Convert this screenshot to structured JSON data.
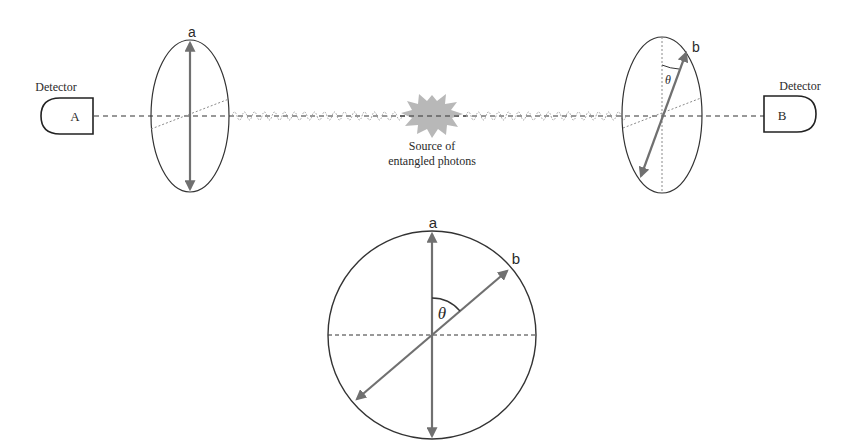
{
  "figure": {
    "detectors": [
      {
        "id": "A",
        "caption": "Detector",
        "letter": "A",
        "side": "left"
      },
      {
        "id": "B",
        "caption": "Detector",
        "letter": "B",
        "side": "right"
      }
    ],
    "polarizers": [
      {
        "id": "a",
        "label": "a",
        "axis_angle_deg": 0
      },
      {
        "id": "b",
        "label": "b",
        "axis_angle_deg": 20,
        "angle_label": "θ"
      }
    ],
    "source": {
      "label_line1": "Source of",
      "label_line2": "entangled photons"
    },
    "inset": {
      "label_a": "a",
      "label_b": "b",
      "angle_label": "θ",
      "angle_between_deg": 55
    },
    "colors": {
      "line": "#333333",
      "arrow": "#707070",
      "dotted": "#8a8a8a",
      "burst": "#b8b8b8",
      "wave": "#9a9a9a"
    }
  }
}
